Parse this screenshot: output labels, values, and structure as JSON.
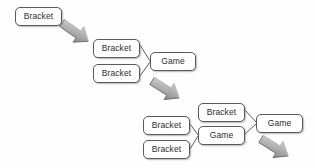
{
  "diagram": {
    "type": "flowchart-progression",
    "canvas": {
      "width": 315,
      "height": 168
    },
    "colors": {
      "background": "#fefefe",
      "box_fill": "#ffffff",
      "box_border": "#5a5a5a",
      "text": "#2b2b2b",
      "connector_line": "#4a4a4a",
      "arrow_fill": "#a8a8a8",
      "arrow_fill_light": "#cfcfcf",
      "arrow_border": "#6e6e6e"
    },
    "labels": {
      "bracket": "Bracket",
      "game": "Game"
    },
    "stages": [
      {
        "name": "stage-1",
        "nodes": [
          {
            "id": "s1-bracket-1",
            "label": "Bracket",
            "x": 15,
            "y": 7,
            "w": 47,
            "h": 19
          }
        ]
      },
      {
        "name": "stage-2",
        "nodes": [
          {
            "id": "s2-bracket-1",
            "label": "Bracket",
            "x": 93,
            "y": 39,
            "w": 47,
            "h": 19
          },
          {
            "id": "s2-bracket-2",
            "label": "Bracket",
            "x": 93,
            "y": 64,
            "w": 47,
            "h": 19
          },
          {
            "id": "s2-game-1",
            "label": "Game",
            "x": 150,
            "y": 52,
            "w": 46,
            "h": 19
          }
        ]
      },
      {
        "name": "stage-3",
        "nodes": [
          {
            "id": "s3-bracket-1",
            "label": "Bracket",
            "x": 143,
            "y": 116,
            "w": 47,
            "h": 19
          },
          {
            "id": "s3-bracket-2",
            "label": "Bracket",
            "x": 143,
            "y": 140,
            "w": 47,
            "h": 19
          },
          {
            "id": "s3-bracket-3",
            "label": "Bracket",
            "x": 198,
            "y": 103,
            "w": 47,
            "h": 19
          },
          {
            "id": "s3-game-1",
            "label": "Game",
            "x": 198,
            "y": 126,
            "w": 47,
            "h": 19
          },
          {
            "id": "s3-game-2",
            "label": "Game",
            "x": 256,
            "y": 114,
            "w": 47,
            "h": 19
          }
        ]
      }
    ],
    "connectors": [
      {
        "id": "conn-s2-top",
        "from": "s2-bracket-1",
        "to": "s2-game-1"
      },
      {
        "id": "conn-s2-bottom",
        "from": "s2-bracket-2",
        "to": "s2-game-1"
      },
      {
        "id": "conn-s3-left-top",
        "from": "s3-bracket-1",
        "to": "s3-game-1"
      },
      {
        "id": "conn-s3-left-bottom",
        "from": "s3-bracket-2",
        "to": "s3-game-1"
      },
      {
        "id": "conn-s3-mid-top",
        "from": "s3-bracket-3",
        "to": "s3-game-2"
      },
      {
        "id": "conn-s3-mid-bottom",
        "from": "s3-game-1",
        "to": "s3-game-2"
      }
    ],
    "arrows": [
      {
        "id": "arrow-1",
        "name": "stage-transition-arrow-1",
        "direction": "down-right",
        "x": 62,
        "y": 23,
        "length": 34
      },
      {
        "id": "arrow-2",
        "name": "stage-transition-arrow-2",
        "direction": "down-right",
        "x": 152,
        "y": 81,
        "length": 34
      },
      {
        "id": "arrow-3",
        "name": "stage-transition-arrow-3",
        "direction": "down-right",
        "x": 261,
        "y": 139,
        "length": 34
      }
    ]
  }
}
